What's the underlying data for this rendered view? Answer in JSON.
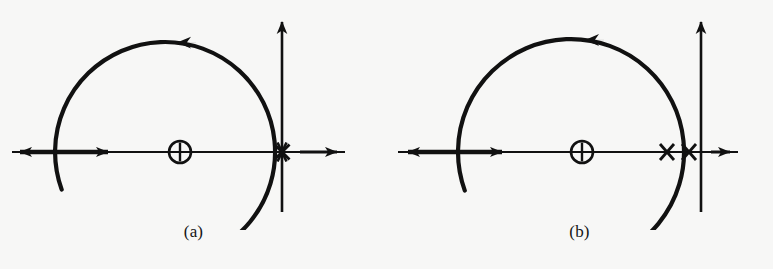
{
  "figure": {
    "background_color": "#f7f7f6",
    "ink_color": "#111111",
    "panel_count": 2
  },
  "panels": [
    {
      "id": "a",
      "caption": "(a)",
      "description": "Bromwich / Nyquist contour in the complex plane with a double pole located exactly on the imaginary axis",
      "axes": {
        "real_axis": {
          "name": "real-axis",
          "y": 152,
          "x_start": 12,
          "x_end": 345,
          "left_arrow": true,
          "right_arrow": true
        },
        "imaginary_axis": {
          "name": "imaginary-axis",
          "x": 282,
          "y_top": 12,
          "y_bottom": 212,
          "up_arrow": true
        }
      },
      "contour": {
        "type": "large-semicircle-arc",
        "center_x": 165,
        "center_y": 152,
        "radius": 110,
        "start_angle_deg": 200,
        "end_angle_deg": -60,
        "direction": "counterclockwise",
        "direction_arrow": {
          "name": "arc-direction-arrow",
          "position": "top",
          "points": "left"
        }
      },
      "real_axis_direction_arrow": {
        "name": "real-axis-direction-arrow",
        "x": 112,
        "points": "right"
      },
      "markers": [
        {
          "kind": "zero",
          "glyph": "circle-plus",
          "label": "⊕",
          "x": 180,
          "y": 152,
          "radius": 11
        },
        {
          "kind": "pole",
          "glyph": "cross",
          "label": "×",
          "x": 282,
          "y": 152,
          "multiplicity": 2,
          "note": "double pole on the imaginary axis"
        }
      ]
    },
    {
      "id": "b",
      "caption": "(b)",
      "description": "Same contour with the double pole split into two simple poles straddling the imaginary axis",
      "axes": {
        "real_axis": {
          "name": "real-axis",
          "y": 152,
          "x_start": 12,
          "x_end": 345,
          "left_arrow": true,
          "right_arrow": true
        },
        "imaginary_axis": {
          "name": "imaginary-axis",
          "x": 315,
          "y_top": 12,
          "y_bottom": 212,
          "up_arrow": true
        }
      },
      "contour": {
        "type": "large-semicircle-arc",
        "center_x": 185,
        "center_y": 152,
        "radius": 113,
        "start_angle_deg": 200,
        "end_angle_deg": -60,
        "direction": "counterclockwise",
        "direction_arrow": {
          "name": "arc-direction-arrow",
          "position": "top",
          "points": "left"
        }
      },
      "real_axis_direction_arrow": {
        "name": "real-axis-direction-arrow",
        "x": 120,
        "points": "right"
      },
      "markers": [
        {
          "kind": "zero",
          "glyph": "circle-plus",
          "label": "⊕",
          "x": 196,
          "y": 152,
          "radius": 11
        },
        {
          "kind": "pole",
          "glyph": "cross",
          "label": "×",
          "x": 281,
          "y": 152,
          "multiplicity": 1,
          "note": "pole left of the imaginary axis"
        },
        {
          "kind": "pole",
          "glyph": "cross",
          "label": "×",
          "x": 303,
          "y": 152,
          "multiplicity": 1,
          "note": "pole right of the arc, left of imaginary axis"
        }
      ]
    }
  ]
}
